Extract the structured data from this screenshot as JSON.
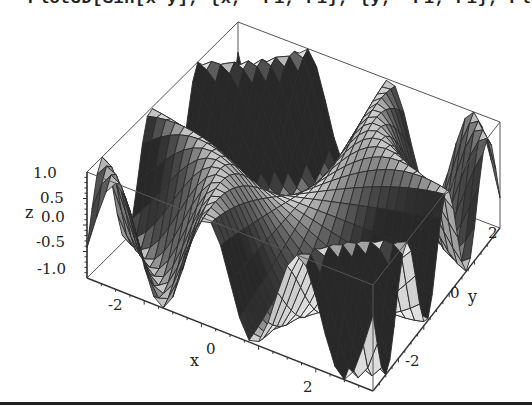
{
  "code_line": "Plot3D[Sin[x y], {x, -Pi, Pi}, {y, -Pi, Pi}, PlotPoints 50",
  "chart_data": {
    "type": "surface3d",
    "title": "",
    "function": "z = sin(x*y)",
    "x_range": [
      -3.14159,
      3.14159
    ],
    "y_range": [
      -3.14159,
      3.14159
    ],
    "z_range": [
      -1.0,
      1.0
    ],
    "xlabel": "x",
    "ylabel": "y",
    "zlabel": "z",
    "x_ticks": [
      "-2",
      "0",
      "2"
    ],
    "y_ticks": [
      "-2",
      "0",
      "2"
    ],
    "z_ticks": [
      "1.0",
      "0.5",
      "0.0",
      "-0.5",
      "-1.0"
    ],
    "mesh": true,
    "boxed": true,
    "grid_points": 30,
    "shading": "grayscale"
  },
  "colors": {
    "background": "#ffffff",
    "box": "#555555",
    "mesh": "#2a2a2a",
    "rule": "#222222"
  }
}
